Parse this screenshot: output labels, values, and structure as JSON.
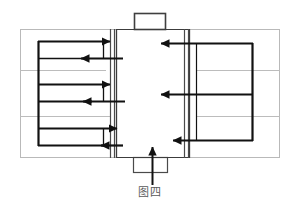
{
  "figure": {
    "caption": "图四",
    "caption_meaning": "Figure Four",
    "type": "technical-schematic",
    "colors": {
      "stroke_dark": "#1a1a1a",
      "stroke_medium": "#3c3c3c",
      "stroke_light": "#b5b5b5",
      "background": "#ffffff",
      "caption_text": "#5a5a5a"
    },
    "outer_frame": {
      "name": "outer-housing",
      "x": 20,
      "y": 29,
      "width": 260,
      "height": 129,
      "stroke": "#b5b5b5",
      "stroke_width": 1
    },
    "central_chamber": {
      "name": "central-chamber",
      "x": 115,
      "y": 29,
      "width": 75,
      "height": 129,
      "stroke": "#3c3c3c"
    },
    "left_channel": {
      "name": "left-vertical-channel",
      "x1": 110,
      "x2": 116,
      "y_top": 29,
      "y_bottom": 158
    },
    "right_channel": {
      "name": "right-vertical-channel",
      "x1": 184,
      "x2": 190,
      "y_top": 29,
      "y_bottom": 158
    },
    "top_nozzle": {
      "name": "top-outlet-nozzle",
      "x": 134,
      "y": 13,
      "width": 32,
      "height": 17
    },
    "bottom_nozzle": {
      "name": "bottom-inlet-nozzle",
      "x": 133,
      "y": 157,
      "width": 34,
      "height": 16
    },
    "inlet_arrow": {
      "name": "bottom-inlet-arrow",
      "direction": "up",
      "x": 152,
      "y_tail": 185,
      "y_tip": 139
    },
    "left_manifold": {
      "name": "left-manifold-spine",
      "x": 38,
      "y_top": 41,
      "y_bottom": 146
    },
    "right_manifold": {
      "name": "right-manifold-spine",
      "x": 253,
      "y_top": 43,
      "y_bottom": 141
    },
    "left_rows": [
      {
        "id": 1,
        "y": 41,
        "direction": "right",
        "from_x": 38,
        "to_x": 118,
        "arrow_x": 118
      },
      {
        "id": 2,
        "y": 58,
        "direction": "left",
        "from_x": 122,
        "to_x": 72,
        "arrow_x": 72
      },
      {
        "id": 3,
        "y": 84,
        "direction": "right",
        "from_x": 38,
        "to_x": 118,
        "arrow_x": 118
      },
      {
        "id": 4,
        "y": 101,
        "direction": "left",
        "from_x": 122,
        "to_x": 72,
        "arrow_x": 72
      },
      {
        "id": 5,
        "y": 128,
        "direction": "right",
        "from_x": 38,
        "to_x": 125,
        "arrow_x": 125
      },
      {
        "id": 6,
        "y": 145,
        "direction": "left",
        "from_x": 122,
        "to_x": 92,
        "arrow_x": 92
      }
    ],
    "right_rows": [
      {
        "id": 1,
        "y": 43,
        "direction": "left",
        "from_x": 253,
        "to_x": 152,
        "arrow_x": 152
      },
      {
        "id": 2,
        "y": 95,
        "direction": "left",
        "from_x": 253,
        "to_x": 152,
        "arrow_x": 152
      },
      {
        "id": 3,
        "y": 140,
        "direction": "left",
        "from_x": 253,
        "to_x": 164,
        "arrow_x": 164
      }
    ],
    "left_hairlines": [
      {
        "y": 70,
        "x1": 20,
        "x2": 106
      },
      {
        "y": 116,
        "x1": 20,
        "x2": 110
      }
    ],
    "right_hairlines": [
      {
        "y": 70,
        "x1": 196,
        "x2": 280
      },
      {
        "y": 116,
        "x1": 196,
        "x2": 280
      }
    ],
    "labels": {
      "left_section": "left serpentine channel",
      "right_section": "right serpentine channel",
      "center_section": "central chamber"
    }
  }
}
